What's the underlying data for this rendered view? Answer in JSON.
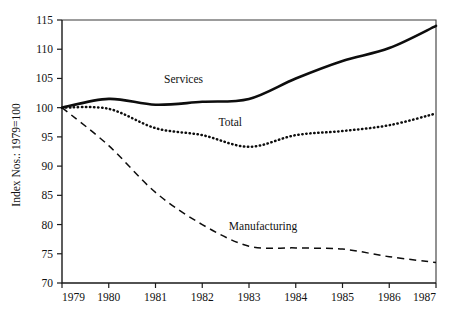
{
  "chart_data": {
    "type": "line",
    "title": "",
    "subtitle": "",
    "xlabel": "",
    "ylabel": "Index Nos.: 1979=100",
    "x": [
      1979,
      1980,
      1981,
      1982,
      1983,
      1984,
      1985,
      1986,
      1987
    ],
    "xtick_labels": [
      "1979",
      "1980",
      "1981",
      "1982",
      "1983",
      "1984",
      "1985",
      "1986",
      "1987"
    ],
    "ytick_labels": [
      "70",
      "75",
      "80",
      "85",
      "90",
      "95",
      "100",
      "105",
      "110",
      "115"
    ],
    "yticks": [
      70,
      75,
      80,
      85,
      90,
      95,
      100,
      105,
      110,
      115
    ],
    "xlim": [
      1979,
      1987
    ],
    "ylim": [
      70,
      115
    ],
    "grid": false,
    "legend_position": "inline-annotations",
    "series": [
      {
        "name": "Services",
        "style": "solid-thick",
        "values": [
          100,
          101.5,
          100.5,
          101,
          101.5,
          105,
          108,
          110.2,
          114
        ],
        "label_x": 1981.6,
        "label_y": 104.2
      },
      {
        "name": "Total",
        "style": "dotted",
        "values": [
          100,
          99.8,
          96.5,
          95.3,
          93.3,
          95.3,
          96,
          97,
          99
        ],
        "label_x": 1982.6,
        "label_y": 96.8
      },
      {
        "name": "Manufacturing",
        "style": "dashed",
        "values": [
          100,
          93.5,
          85.5,
          80,
          76.3,
          76,
          75.8,
          74.5,
          73.5
        ],
        "label_x": 1983.3,
        "label_y": 79.0
      }
    ],
    "annotations": [
      {
        "text": "Services",
        "series": "Services"
      },
      {
        "text": "Total",
        "series": "Total"
      },
      {
        "text": "Manufacturing",
        "series": "Manufacturing"
      }
    ],
    "colors": {
      "line": "#0d0d0d",
      "axis": "#1a1a1a",
      "frame": "#3a3a3a",
      "background": "#ffffff",
      "text": "#111111"
    }
  }
}
